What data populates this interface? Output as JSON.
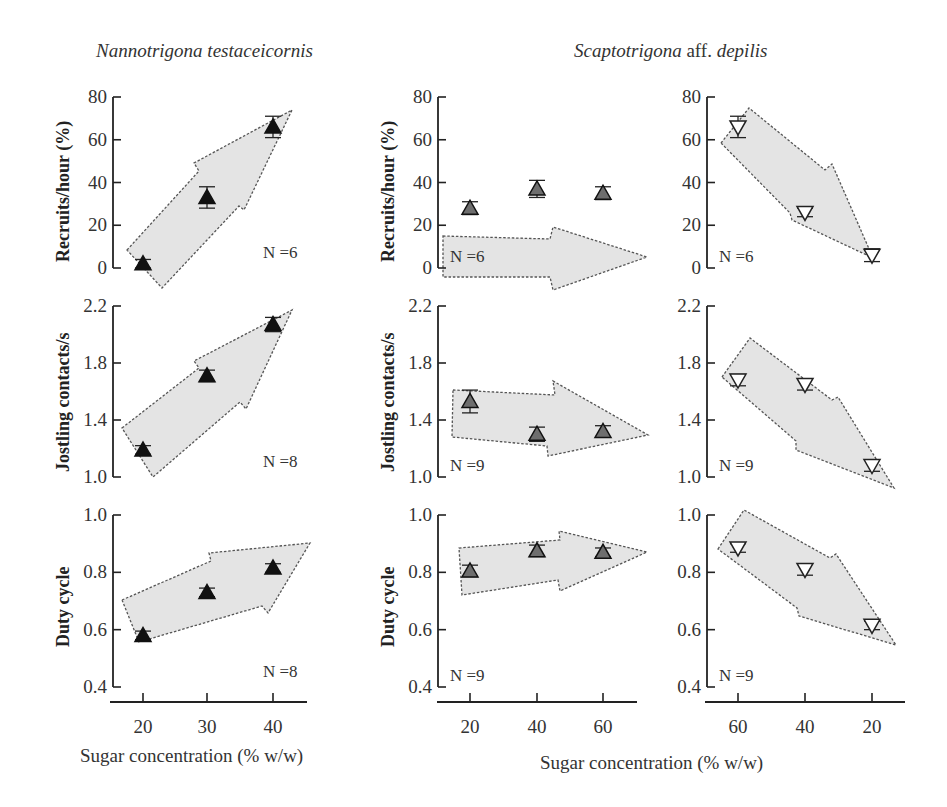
{
  "titles": {
    "left": {
      "italic": "Nannotrigona testaceicornis"
    },
    "right": {
      "italic_a": "Scaptotrigona",
      "plain": " aff. ",
      "italic_b": "depilis"
    }
  },
  "xlabels": {
    "left": "Sugar concentration (% w/w)",
    "right": "Sugar concentration (% w/w)"
  },
  "ylabels": {
    "row0": "Recruits/hour (%)",
    "row1": "Jostling contacts/s",
    "row2": "Duty cycle"
  },
  "colors": {
    "arrow_fill": "#e4e4e4",
    "arrow_stroke": "#555555",
    "marker_black": "#111111",
    "marker_gray": "#6e6e6e",
    "axis": "#222222"
  },
  "chart_data": [
    {
      "type": "scatter",
      "panel": "N. testaceicornis - recruits",
      "xlabel": "Sugar concentration (% w/w)",
      "ylabel": "Recruits/hour (%)",
      "x": [
        20,
        30,
        40
      ],
      "y": [
        2,
        33,
        66
      ],
      "err": [
        2,
        5,
        5
      ],
      "ylim": [
        0,
        80
      ],
      "yticks": [
        0,
        20,
        40,
        60,
        80
      ],
      "xticks": [
        20,
        30,
        40
      ],
      "n": "N =6",
      "marker": "triangle-up-black",
      "trend": "increasing"
    },
    {
      "type": "scatter",
      "panel": "S. aff. depilis (ascending) - recruits",
      "ylabel": "Recruits/hour (%)",
      "x": [
        20,
        40,
        60
      ],
      "y": [
        28,
        37,
        35
      ],
      "err": [
        3,
        4,
        3
      ],
      "ylim": [
        0,
        80
      ],
      "yticks": [
        0,
        20,
        40,
        60,
        80
      ],
      "xticks": [
        20,
        40,
        60
      ],
      "n": "N =6",
      "marker": "triangle-up-gray",
      "trend": "flat"
    },
    {
      "type": "scatter",
      "panel": "S. aff. depilis (descending) - recruits",
      "ylabel": "Recruits/hour (%)",
      "x": [
        60,
        40,
        20
      ],
      "y": [
        66,
        26,
        6
      ],
      "err": [
        5,
        2,
        3
      ],
      "ylim": [
        0,
        80
      ],
      "yticks": [
        0,
        20,
        40,
        60,
        80
      ],
      "xticks": [
        60,
        40,
        20
      ],
      "n": "N =6",
      "marker": "triangle-down-open",
      "trend": "decreasing"
    },
    {
      "type": "scatter",
      "panel": "N. testaceicornis - jostling",
      "ylabel": "Jostling contacts/s",
      "x": [
        20,
        30,
        40
      ],
      "y": [
        1.19,
        1.71,
        2.07
      ],
      "err": [
        0.03,
        0.04,
        0.05
      ],
      "ylim": [
        1.0,
        2.2
      ],
      "yticks": [
        1.0,
        1.4,
        1.8,
        2.2
      ],
      "xticks": [
        20,
        30,
        40
      ],
      "n": "N =8",
      "marker": "triangle-up-black",
      "trend": "increasing"
    },
    {
      "type": "scatter",
      "panel": "S. aff. depilis (ascending) - jostling",
      "ylabel": "Jostling contacts/s",
      "x": [
        20,
        40,
        60
      ],
      "y": [
        1.53,
        1.3,
        1.32
      ],
      "err": [
        0.08,
        0.05,
        0.04
      ],
      "ylim": [
        1.0,
        2.2
      ],
      "yticks": [
        1.0,
        1.4,
        1.8,
        2.2
      ],
      "xticks": [
        20,
        40,
        60
      ],
      "n": "N =9",
      "marker": "triangle-up-gray",
      "trend": "flat"
    },
    {
      "type": "scatter",
      "panel": "S. aff. depilis (descending) - jostling",
      "ylabel": "Jostling contacts/s",
      "x": [
        60,
        40,
        20
      ],
      "y": [
        1.68,
        1.65,
        1.08
      ],
      "err": [
        0.04,
        0.04,
        0.04
      ],
      "ylim": [
        1.0,
        2.2
      ],
      "yticks": [
        1.0,
        1.4,
        1.8,
        2.2
      ],
      "xticks": [
        60,
        40,
        20
      ],
      "n": "N =9",
      "marker": "triangle-down-open",
      "trend": "decreasing"
    },
    {
      "type": "scatter",
      "panel": "N. testaceicornis - duty cycle",
      "ylabel": "Duty cycle",
      "x": [
        20,
        30,
        40
      ],
      "y": [
        0.58,
        0.73,
        0.815
      ],
      "err": [
        0.015,
        0.015,
        0.015
      ],
      "ylim": [
        0.4,
        1.0
      ],
      "yticks": [
        0.4,
        0.6,
        0.8,
        1.0
      ],
      "xticks": [
        20,
        30,
        40
      ],
      "n": "N =8",
      "marker": "triangle-up-black",
      "trend": "increasing"
    },
    {
      "type": "scatter",
      "panel": "S. aff. depilis (ascending) - duty cycle",
      "ylabel": "Duty cycle",
      "x": [
        20,
        40,
        60
      ],
      "y": [
        0.805,
        0.875,
        0.87
      ],
      "err": [
        0.02,
        0.02,
        0.015
      ],
      "ylim": [
        0.4,
        1.0
      ],
      "yticks": [
        0.4,
        0.6,
        0.8,
        1.0
      ],
      "xticks": [
        20,
        40,
        60
      ],
      "n": "N =9",
      "marker": "triangle-up-gray",
      "trend": "flat"
    },
    {
      "type": "scatter",
      "panel": "S. aff. depilis (descending) - duty cycle",
      "ylabel": "Duty cycle",
      "x": [
        60,
        40,
        20
      ],
      "y": [
        0.885,
        0.81,
        0.615
      ],
      "err": [
        0.015,
        0.02,
        0.015
      ],
      "ylim": [
        0.4,
        1.0
      ],
      "yticks": [
        0.4,
        0.6,
        0.8,
        1.0
      ],
      "xticks": [
        60,
        40,
        20
      ],
      "n": "N =9",
      "marker": "triangle-down-open",
      "trend": "decreasing"
    }
  ]
}
